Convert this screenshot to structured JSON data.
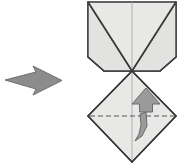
{
  "figure": {
    "title": "Origami fold step diagram",
    "background_color": "#ffffff"
  },
  "style": {
    "paper_fill": "#e8e8e6",
    "paper_fill_shaded": "#e2e2e0",
    "crease_stroke": "#3c3c3c",
    "outline_stroke": "#333333",
    "soft_stroke": "#a9a9a9",
    "dash_stroke": "#555555",
    "arrow_fill": "#8c8c8c",
    "arrow_stroke": "#6e6e6e",
    "curved_arrow_fill": "#9a9a9a",
    "curved_arrow_stroke": "#6a6a6a",
    "outline_width": 1.4,
    "crease_width": 1.4,
    "soft_width": 0.9,
    "dash_width": 1.1,
    "dash_pattern": "5,3"
  },
  "transition_arrow": {
    "name": "step transition arrow",
    "direction": "right",
    "points": "5,80 36,72 33,66 62,80.5 33,95 36,89",
    "fill": "#8c8c8c",
    "stroke": "#6e6e6e"
  },
  "model": {
    "name": "origami model",
    "center_x": 132,
    "top_y": 2,
    "bottom_y": 162,
    "left_x": 88,
    "right_x": 176,
    "convergence_point": {
      "x": 132,
      "y": 71
    },
    "upper": {
      "name": "upper folded section",
      "body": "88,2 176,2 176,57 160,71 132,71 104,71 88,57",
      "left_flap": "88,2 132,71 104,71 88,57",
      "right_flap": "176,2 132,71 160,71 176,57",
      "left_inner_crease": "88,2 132,71",
      "right_inner_crease": "176,2 132,71",
      "left_notch_crease": "88,57 104,71",
      "right_notch_crease": "176,57 160,71",
      "left_top_edge": "88,2 176,2"
    },
    "lower": {
      "name": "lower diamond section",
      "diamond": "132,71 176,116 132,162 88,116",
      "left_upper_edge": "88,116 132,71",
      "right_upper_edge": "176,116 132,71",
      "left_lower_edge": "88,116 132,162",
      "right_lower_edge": "176,116 132,162"
    },
    "center_line": "132,2 132,162",
    "valley_fold": {
      "name": "valley fold line",
      "label": "",
      "x1": 90,
      "y1": 116,
      "x2": 174,
      "y2": 116,
      "style": "dashed"
    },
    "fold_arrow": {
      "name": "fold direction arrow",
      "direction": "up",
      "head": "146,88 160,104 152.5,104 152.5,112 139.5,112 139.5,104 132,104",
      "tail": "146,112 147,126 142,136 135,141 139,134 141,125 140,114",
      "fill": "#9a9a9a",
      "stroke": "#6a6a6a"
    }
  }
}
